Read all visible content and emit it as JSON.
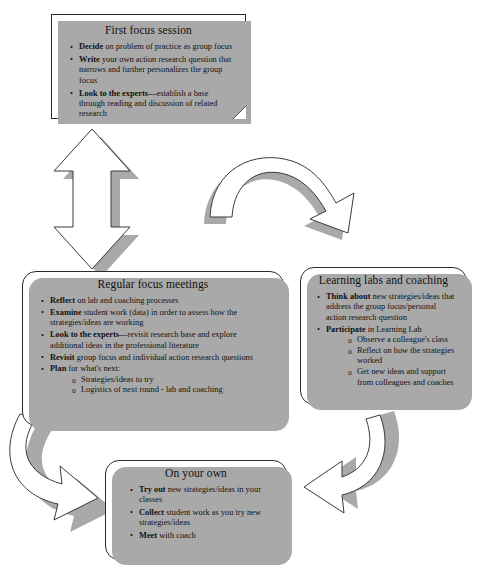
{
  "diagram": {
    "colors": {
      "box_fill": "#ffffff",
      "box_border": "#2b2b2b",
      "shadow": "#a9a9a9",
      "text": "#111111"
    }
  },
  "boxes": {
    "first_focus_session": {
      "title": "First focus session",
      "bullets": [
        {
          "lead": "Decide",
          "rest": " on problem of practice as group focus"
        },
        {
          "lead": "Write",
          "rest": " your own action research question that narrows and further personalizes the group focus"
        },
        {
          "lead": "Look to the experts",
          "rest": "—establish a base through reading and discussion of related research"
        }
      ]
    },
    "regular_focus_meetings": {
      "title": "Regular focus meetings",
      "bullets": [
        {
          "lead": "Reflect",
          "rest": " on lab and coaching processes"
        },
        {
          "lead": "Examine",
          "rest": " student work (data) in order to assess how the strategies/ideas are working"
        },
        {
          "lead": "Look to the experts",
          "rest": "—revisit  research base and explore additional ideas in the professional literature"
        },
        {
          "lead": "Revisit",
          "rest": "  group focus and individual action research questions"
        },
        {
          "lead": "Plan",
          "rest": " for what's next:"
        }
      ],
      "sub_bullets": [
        "Strategies/ideas to try",
        "Logistics  of next round - lab and coaching"
      ]
    },
    "learning_labs_and_coaching": {
      "title": "Learning labs and coaching",
      "bullets": [
        {
          "lead": "Think about",
          "rest": " new strategies/ideas that address the group focus/personal action research question"
        },
        {
          "lead": "Participate",
          "rest": " in Learning Lab"
        }
      ],
      "sub_bullets": [
        "Observe a colleague's class",
        "Reflect on how the strategies worked",
        "Get new ideas and support from colleagues and coaches"
      ]
    },
    "on_your_own": {
      "title": "On your own",
      "bullets": [
        {
          "lead": "Try out",
          "rest": " new strategies/ideas in your classes"
        },
        {
          "lead": "Collect",
          "rest": " student work as you try new strategies/ideas"
        },
        {
          "lead": "Meet",
          "rest": " with coach"
        }
      ]
    }
  },
  "arrows": {
    "vertical_double": "double-headed-vertical-arrow",
    "top_curved": "curved-arrow-right-down",
    "right_curved": "curved-arrow-down-left",
    "left_curved": "curved-arrow-up-left"
  }
}
